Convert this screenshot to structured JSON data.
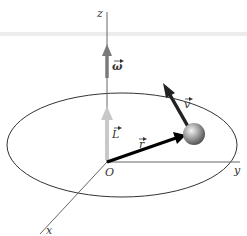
{
  "diagram": {
    "axes": {
      "z_label": "z",
      "y_label": "y",
      "x_label": "x",
      "origin_label": "O"
    },
    "vectors": {
      "omega_label": "ω",
      "L_label": "L",
      "r_label": "r",
      "v_label": "v"
    },
    "colors": {
      "axis": "#555555",
      "omega": "#7a7a7a",
      "L": "#c8c8c8",
      "r": "#000000",
      "v": "#222222",
      "orbit": "#333333",
      "top_band": "#e6e6e6"
    }
  }
}
